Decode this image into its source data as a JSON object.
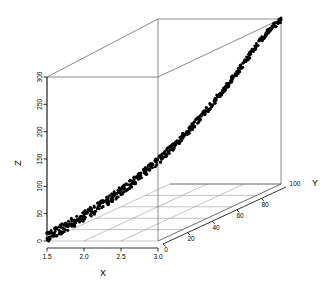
{
  "chart_data": {
    "type": "scatter",
    "subtype": "scatter3d",
    "title": "",
    "xlabel": "X",
    "ylabel": "Y",
    "zlabel": "Z",
    "xlim": [
      1.5,
      3.0
    ],
    "ylim": [
      0,
      100
    ],
    "zlim": [
      0,
      300
    ],
    "xticks": [
      1.5,
      2.0,
      2.5,
      3.0
    ],
    "yticks": [
      0,
      20,
      40,
      60,
      80,
      100
    ],
    "zticks": [
      0,
      50,
      100,
      150,
      200,
      250,
      300
    ],
    "xtick_labels": [
      "1.5",
      "2.0",
      "2.5",
      "3.0"
    ],
    "ytick_labels": [
      "0",
      "20",
      "40",
      "60",
      "80",
      "100"
    ],
    "ztick_labels": [
      "0",
      "50",
      "100",
      "150",
      "200",
      "250",
      "300"
    ],
    "grid": true,
    "legend": false,
    "point_color": "#000000",
    "box_color": "#5a5a5a",
    "grid_color": "#9a9a9a",
    "n_points": 600,
    "relation": "Z increases convexly with X and Y along a tight diagonal band",
    "points_note": "Points lie on a narrow band; Z is approximately a convex increasing function of position along the X-Y diagonal",
    "band_samples": [
      {
        "t": 0.0,
        "x": 1.5,
        "y": 0,
        "z": 8
      },
      {
        "t": 0.05,
        "x": 1.575,
        "y": 5,
        "z": 14
      },
      {
        "t": 0.1,
        "x": 1.65,
        "y": 10,
        "z": 21
      },
      {
        "t": 0.15,
        "x": 1.725,
        "y": 15,
        "z": 28
      },
      {
        "t": 0.2,
        "x": 1.8,
        "y": 20,
        "z": 36
      },
      {
        "t": 0.25,
        "x": 1.875,
        "y": 25,
        "z": 45
      },
      {
        "t": 0.3,
        "x": 1.95,
        "y": 30,
        "z": 55
      },
      {
        "t": 0.35,
        "x": 2.025,
        "y": 35,
        "z": 66
      },
      {
        "t": 0.4,
        "x": 2.1,
        "y": 40,
        "z": 78
      },
      {
        "t": 0.45,
        "x": 2.175,
        "y": 45,
        "z": 91
      },
      {
        "t": 0.5,
        "x": 2.25,
        "y": 50,
        "z": 105
      },
      {
        "t": 0.55,
        "x": 2.325,
        "y": 55,
        "z": 120
      },
      {
        "t": 0.6,
        "x": 2.4,
        "y": 60,
        "z": 137
      },
      {
        "t": 0.65,
        "x": 2.475,
        "y": 65,
        "z": 155
      },
      {
        "t": 0.7,
        "x": 2.55,
        "y": 70,
        "z": 175
      },
      {
        "t": 0.75,
        "x": 2.625,
        "y": 75,
        "z": 196
      },
      {
        "t": 0.8,
        "x": 2.7,
        "y": 80,
        "z": 218
      },
      {
        "t": 0.85,
        "x": 2.775,
        "y": 85,
        "z": 242
      },
      {
        "t": 0.9,
        "x": 2.85,
        "y": 90,
        "z": 266
      },
      {
        "t": 0.95,
        "x": 2.925,
        "y": 95,
        "z": 288
      },
      {
        "t": 1.0,
        "x": 3.0,
        "y": 100,
        "z": 300
      }
    ]
  }
}
